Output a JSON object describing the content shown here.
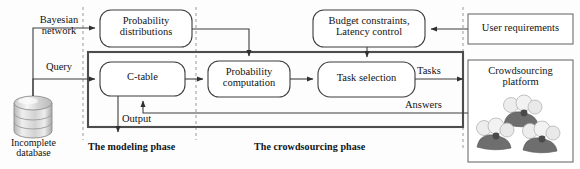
{
  "diagram": {
    "colors": {
      "stroke": "#3d3d3d",
      "thick_stroke": "#4a4a4a",
      "dashed": "#8d8d8d",
      "text": "#131313",
      "background": "#fdfdfd",
      "people_dark": "#6f6f6f",
      "people_light": "#e8e8e8",
      "db_fill": "#e3e3e3"
    },
    "nodes": [
      {
        "id": "probability-distributions",
        "label": "Probability\ndistributions",
        "shape": "rounded-rect"
      },
      {
        "id": "budget-latency",
        "label": "Budget constraints,\nLatency control",
        "shape": "rounded-rect"
      },
      {
        "id": "user-requirements",
        "label": "User requirements",
        "shape": "rect"
      },
      {
        "id": "c-table",
        "label": "C-table",
        "shape": "rounded-rect"
      },
      {
        "id": "probability-computation",
        "label": "Probability\ncomputation",
        "shape": "rounded-rect"
      },
      {
        "id": "task-selection",
        "label": "Task selection",
        "shape": "rounded-rect"
      },
      {
        "id": "crowdsourcing-platform",
        "label": "Crowdsourcing\nplatform",
        "shape": "rect"
      },
      {
        "id": "incomplete-database",
        "label": "Incomplete\ndatabase",
        "shape": "cylinder"
      }
    ],
    "edge_labels": [
      {
        "id": "bayesian-network",
        "label": "Bayesian\nnetwork"
      },
      {
        "id": "query",
        "label": "Query"
      },
      {
        "id": "output",
        "label": "Output"
      },
      {
        "id": "tasks",
        "label": "Tasks"
      },
      {
        "id": "answers",
        "label": "Answers"
      }
    ],
    "phases": [
      {
        "id": "modeling-phase",
        "label": "The modeling phase"
      },
      {
        "id": "crowdsourcing-phase",
        "label": "The crowdsourcing phase"
      }
    ]
  }
}
